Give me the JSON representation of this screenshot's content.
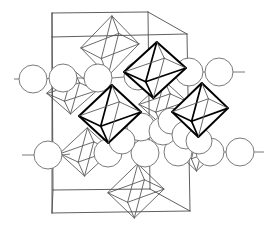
{
  "figure": {
    "kind": "crystal-structure-diagram",
    "title": "",
    "caption": "",
    "width": 267,
    "height": 234,
    "background_color": "#ffffff"
  },
  "style": {
    "cell_edge_color": "#4d4d4d",
    "cell_edge_width": 0.9,
    "sphere_fill": "#ffffff",
    "sphere_stroke": "#6b6b6b",
    "sphere_stroke_width": 0.9,
    "octahedron_light_stroke": "#5a5a5a",
    "octahedron_light_width": 0.9,
    "octahedron_bold_stroke": "#000000",
    "octahedron_bold_width": 2.0
  },
  "unit_cell": {
    "label": "unit-cell-outline",
    "projection": "oblique",
    "vertices": {
      "front_top_left": [
        52,
        37
      ],
      "front_top_right": [
        187,
        34
      ],
      "front_bottom_left": [
        52,
        213
      ],
      "front_bottom_right": [
        190,
        211
      ],
      "back_top_left": [
        52,
        13
      ],
      "back_top_right": [
        148,
        12
      ],
      "back_bottom_left": [
        53,
        190
      ],
      "back_bottom_right": [
        150,
        189
      ]
    },
    "edges": [
      [
        "front_top_left",
        "front_top_right"
      ],
      [
        "front_top_right",
        "front_bottom_right"
      ],
      [
        "front_bottom_right",
        "front_bottom_left"
      ],
      [
        "front_bottom_left",
        "front_top_left"
      ],
      [
        "back_top_left",
        "back_top_right"
      ],
      [
        "back_top_right",
        "back_bottom_right"
      ],
      [
        "back_bottom_right",
        "back_bottom_left"
      ],
      [
        "back_bottom_left",
        "back_top_left"
      ],
      [
        "front_top_left",
        "back_top_left"
      ],
      [
        "front_top_right",
        "back_top_right"
      ],
      [
        "front_bottom_left",
        "back_bottom_left"
      ],
      [
        "front_bottom_right",
        "back_bottom_right"
      ]
    ]
  },
  "octahedra": {
    "description": "Coordination octahedra drawn in projection; bold ones lie in the front layer, light ones in the back layer.",
    "items": [
      {
        "name": "octahedron-top-back",
        "emphasis": "light",
        "cx": 110,
        "cy": 46,
        "rx": 29,
        "ry": 30,
        "skew": 8
      },
      {
        "name": "octahedron-upper-right-front",
        "emphasis": "bold",
        "cx": 155,
        "cy": 70,
        "rx": 31,
        "ry": 28,
        "skew": 7
      },
      {
        "name": "octahedron-center-front",
        "emphasis": "bold",
        "cx": 110,
        "cy": 114,
        "rx": 31,
        "ry": 29,
        "skew": 7
      },
      {
        "name": "octahedron-right-front",
        "emphasis": "bold",
        "cx": 200,
        "cy": 110,
        "rx": 28,
        "ry": 27,
        "skew": 7
      },
      {
        "name": "octahedron-left-back",
        "emphasis": "light",
        "cx": 86,
        "cy": 152,
        "rx": 26,
        "ry": 24,
        "skew": 6
      },
      {
        "name": "octahedron-bottom-back",
        "emphasis": "light",
        "cx": 136,
        "cy": 191,
        "rx": 28,
        "ry": 27,
        "skew": 7
      },
      {
        "name": "octahedron-upper-left-back",
        "emphasis": "light",
        "cx": 72,
        "cy": 92,
        "rx": 25,
        "ry": 22,
        "skew": 6
      },
      {
        "name": "octahedron-mid-right-back",
        "emphasis": "light",
        "cx": 163,
        "cy": 103,
        "rx": 24,
        "ry": 22,
        "skew": 6
      },
      {
        "name": "octahedron-lower-right-back",
        "emphasis": "light",
        "cx": 198,
        "cy": 150,
        "rx": 22,
        "ry": 21,
        "skew": 6
      }
    ]
  },
  "spheres": {
    "description": "Large anion/cation spheres arranged in two horizontal rows plus a dense cluster on the lower right.",
    "radius_default": 14,
    "rows": [
      {
        "name": "sphere-row-upper",
        "y": 78,
        "items": [
          {
            "name": "sphere-upper-1",
            "cx": 33,
            "cy": 79,
            "r": 14
          },
          {
            "name": "sphere-upper-2",
            "cx": 63,
            "cy": 78,
            "r": 14
          },
          {
            "name": "sphere-upper-3",
            "cx": 98,
            "cy": 78,
            "r": 14
          },
          {
            "name": "sphere-upper-4",
            "cx": 138,
            "cy": 76,
            "r": 14
          },
          {
            "name": "sphere-upper-5",
            "cx": 189,
            "cy": 72,
            "r": 14
          },
          {
            "name": "sphere-upper-6",
            "cx": 219,
            "cy": 72,
            "r": 14
          }
        ]
      },
      {
        "name": "sphere-row-lower",
        "y": 155,
        "items": [
          {
            "name": "sphere-lower-1",
            "cx": 48,
            "cy": 155,
            "r": 14
          },
          {
            "name": "sphere-lower-2",
            "cx": 108,
            "cy": 153,
            "r": 14
          },
          {
            "name": "sphere-lower-3",
            "cx": 145,
            "cy": 153,
            "r": 14
          },
          {
            "name": "sphere-lower-4",
            "cx": 178,
            "cy": 152,
            "r": 14
          },
          {
            "name": "sphere-lower-5",
            "cx": 210,
            "cy": 152,
            "r": 14
          },
          {
            "name": "sphere-lower-6",
            "cx": 240,
            "cy": 152,
            "r": 14
          }
        ]
      }
    ],
    "cluster": {
      "name": "sphere-cluster-lower-right",
      "items": [
        {
          "name": "sphere-cluster-1",
          "cx": 141,
          "cy": 127,
          "r": 14
        },
        {
          "name": "sphere-cluster-2",
          "cx": 163,
          "cy": 131,
          "r": 14
        },
        {
          "name": "sphere-cluster-3",
          "cx": 171,
          "cy": 121,
          "r": 13
        },
        {
          "name": "sphere-cluster-4",
          "cx": 186,
          "cy": 135,
          "r": 14
        },
        {
          "name": "sphere-cluster-5",
          "cx": 122,
          "cy": 141,
          "r": 13
        },
        {
          "name": "sphere-cluster-6",
          "cx": 199,
          "cy": 141,
          "r": 13
        }
      ]
    },
    "bonds": [
      {
        "name": "bond-left-stub-upper",
        "x1": 14,
        "y1": 79,
        "x2": 20,
        "y2": 79
      },
      {
        "name": "bond-upper-1-2",
        "x1": 46,
        "y1": 79,
        "x2": 50,
        "y2": 78
      },
      {
        "name": "bond-upper-2-3",
        "x1": 77,
        "y1": 78,
        "x2": 84,
        "y2": 78
      },
      {
        "name": "bond-upper-3-4",
        "x1": 112,
        "y1": 78,
        "x2": 124,
        "y2": 77
      },
      {
        "name": "bond-upper-5-6",
        "x1": 203,
        "y1": 72,
        "x2": 205,
        "y2": 72
      },
      {
        "name": "bond-right-stub-upper",
        "x1": 233,
        "y1": 72,
        "x2": 245,
        "y2": 72
      },
      {
        "name": "bond-left-stub-lower",
        "x1": 22,
        "y1": 155,
        "x2": 34,
        "y2": 155
      },
      {
        "name": "bond-lower-1-2",
        "x1": 62,
        "y1": 155,
        "x2": 70,
        "y2": 154
      },
      {
        "name": "bond-lower-4-5",
        "x1": 192,
        "y1": 152,
        "x2": 196,
        "y2": 152
      },
      {
        "name": "bond-lower-5-6",
        "x1": 224,
        "y1": 152,
        "x2": 226,
        "y2": 152
      },
      {
        "name": "bond-right-stub-lower",
        "x1": 254,
        "y1": 152,
        "x2": 264,
        "y2": 152
      }
    ]
  },
  "legend": {
    "present": false,
    "entries": []
  },
  "axis_labels": {
    "present": false,
    "entries": []
  }
}
